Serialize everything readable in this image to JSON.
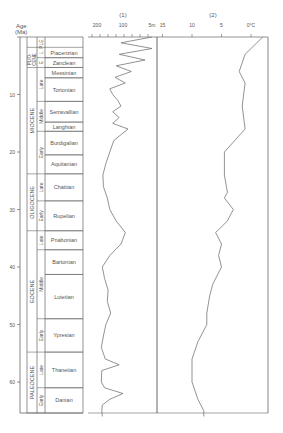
{
  "chart_data": {
    "type": "line",
    "title": "",
    "ylabel": "Age (Ma)",
    "ylim": [
      0,
      66
    ],
    "yticks": [
      "0",
      "10",
      "20",
      "30",
      "40",
      "50",
      "60"
    ],
    "panels": [
      {
        "label": "(1)",
        "description": "Sea-level curve",
        "xticks": [
          "200",
          "100",
          "5m"
        ]
      },
      {
        "label": "(2)",
        "description": "Temperature curve",
        "xticks": [
          "15",
          "10",
          "5",
          "0°C"
        ]
      }
    ],
    "epochs": [
      {
        "name": "PLE",
        "start": 0,
        "end": 1.8
      },
      {
        "name": "PLIO-CENE",
        "start": 1.8,
        "end": 5.3
      },
      {
        "name": "MIOCENE",
        "start": 5.3,
        "end": 23.8
      },
      {
        "name": "OLIGOCENE",
        "start": 23.8,
        "end": 33.7
      },
      {
        "name": "EOCENE",
        "start": 33.7,
        "end": 54.8
      },
      {
        "name": "PALEOCENE",
        "start": 54.8,
        "end": 65.5
      }
    ],
    "subepochs": [
      {
        "name": "L",
        "start": 1.8,
        "end": 3.6
      },
      {
        "name": "E",
        "start": 3.6,
        "end": 5.3
      },
      {
        "name": "Late",
        "start": 5.3,
        "end": 11.2
      },
      {
        "name": "Middle",
        "start": 11.2,
        "end": 16.4
      },
      {
        "name": "Early",
        "start": 16.4,
        "end": 23.8
      },
      {
        "name": "Late",
        "start": 23.8,
        "end": 28.5
      },
      {
        "name": "Early",
        "start": 28.5,
        "end": 33.7
      },
      {
        "name": "Late",
        "start": 33.7,
        "end": 37
      },
      {
        "name": "Middle",
        "start": 37,
        "end": 49
      },
      {
        "name": "Early",
        "start": 49,
        "end": 54.8
      },
      {
        "name": "Late",
        "start": 54.8,
        "end": 61
      },
      {
        "name": "Early",
        "start": 61,
        "end": 65.5
      }
    ],
    "stages": [
      {
        "name": "Piacenzian",
        "start": 1.8,
        "end": 3.6
      },
      {
        "name": "Zanclean",
        "start": 3.6,
        "end": 5.3
      },
      {
        "name": "Messinian",
        "start": 5.3,
        "end": 7.1
      },
      {
        "name": "Tortonian",
        "start": 7.1,
        "end": 11.2
      },
      {
        "name": "Serravallian",
        "start": 11.2,
        "end": 14.8
      },
      {
        "name": "Langhian",
        "start": 14.8,
        "end": 16.4
      },
      {
        "name": "Burdigalian",
        "start": 16.4,
        "end": 20.5
      },
      {
        "name": "Aquitanian",
        "start": 20.5,
        "end": 23.8
      },
      {
        "name": "Chattian",
        "start": 23.8,
        "end": 28.5
      },
      {
        "name": "Rupelian",
        "start": 28.5,
        "end": 33.7
      },
      {
        "name": "Priabonian",
        "start": 33.7,
        "end": 37
      },
      {
        "name": "Bartonian",
        "start": 37,
        "end": 41.3
      },
      {
        "name": "Lutetian",
        "start": 41.3,
        "end": 49
      },
      {
        "name": "Ypresian",
        "start": 49,
        "end": 54.8
      },
      {
        "name": "Thanetian",
        "start": 54.8,
        "end": 61
      },
      {
        "name": "Danian",
        "start": 61,
        "end": 65.5
      }
    ],
    "series": [
      {
        "name": "(1) sea level",
        "points": [
          [
            0,
            5
          ],
          [
            1,
            40
          ],
          [
            2,
            5
          ],
          [
            3,
            45
          ],
          [
            4,
            8
          ],
          [
            5,
            55
          ],
          [
            6,
            20
          ],
          [
            7,
            60
          ],
          [
            8,
            30
          ],
          [
            9,
            85
          ],
          [
            10,
            70
          ],
          [
            11,
            50
          ],
          [
            12,
            40
          ],
          [
            13,
            70
          ],
          [
            14,
            45
          ],
          [
            15,
            70
          ],
          [
            16,
            25
          ],
          [
            18,
            65
          ],
          [
            20,
            85
          ],
          [
            22,
            110
          ],
          [
            24,
            135
          ],
          [
            26,
            130
          ],
          [
            28,
            100
          ],
          [
            30,
            85
          ],
          [
            32,
            55
          ],
          [
            34,
            30
          ],
          [
            36,
            40
          ],
          [
            38,
            85
          ],
          [
            40,
            140
          ],
          [
            42,
            120
          ],
          [
            44,
            95
          ],
          [
            46,
            100
          ],
          [
            48,
            80
          ],
          [
            50,
            110
          ],
          [
            52,
            130
          ],
          [
            54,
            150
          ],
          [
            56,
            115
          ],
          [
            57,
            45
          ],
          [
            58,
            145
          ],
          [
            60,
            150
          ],
          [
            61,
            120
          ],
          [
            62,
            35
          ],
          [
            63,
            85
          ],
          [
            64,
            140
          ],
          [
            65,
            145
          ],
          [
            66,
            140
          ]
        ]
      },
      {
        "name": "(2) temperature °C",
        "points": [
          [
            0,
            -2
          ],
          [
            3,
            1
          ],
          [
            6,
            2
          ],
          [
            8,
            1
          ],
          [
            12,
            1.5
          ],
          [
            16,
            1
          ],
          [
            20,
            4.5
          ],
          [
            24,
            4.5
          ],
          [
            27,
            4
          ],
          [
            28,
            4.5
          ],
          [
            30,
            3
          ],
          [
            32,
            4
          ],
          [
            34,
            6
          ],
          [
            36,
            5
          ],
          [
            38,
            5.5
          ],
          [
            40,
            5
          ],
          [
            43,
            6.5
          ],
          [
            45,
            7
          ],
          [
            48,
            7.5
          ],
          [
            50,
            7.5
          ],
          [
            53,
            9
          ],
          [
            56,
            10
          ],
          [
            60,
            10
          ],
          [
            63,
            9
          ],
          [
            65,
            8
          ],
          [
            66,
            8
          ]
        ]
      }
    ]
  },
  "labels": {
    "age_header_1": "Age",
    "age_header_2": "(Ma)",
    "panel1": "(1)",
    "panel2": "(2)"
  }
}
